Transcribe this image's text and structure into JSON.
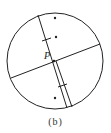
{
  "figure": {
    "caption": "(b)",
    "point_label": "P",
    "colors": {
      "stroke": "#222222",
      "background": "#ffffff"
    },
    "circle": {
      "cx": 55,
      "cy": 61,
      "r": 48
    },
    "lines": [
      {
        "name": "chord-cross",
        "x1": 11,
        "y1": 78,
        "x2": 100,
        "y2": 44
      },
      {
        "name": "chord-main",
        "x1": 38,
        "y1": 15,
        "x2": 67,
        "y2": 108
      },
      {
        "name": "chord-parallel",
        "x1": 54,
        "y1": 61,
        "x2": 72,
        "y2": 106
      }
    ],
    "dots": [
      {
        "cx": 55,
        "cy": 18
      },
      {
        "cx": 56,
        "cy": 37
      },
      {
        "cx": 55,
        "cy": 98
      }
    ],
    "point_p": {
      "x": 54,
      "y": 61
    }
  }
}
